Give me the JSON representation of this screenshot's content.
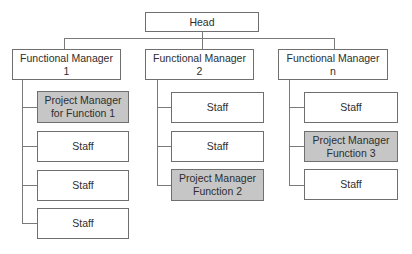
{
  "diagram": {
    "colors": {
      "line": "#7a7a7a",
      "border": "#6f6f6f",
      "pm_fill": "#c6c6c6",
      "staff_fill": "#ffffff",
      "text": "#2e2e2e"
    },
    "head": {
      "label": "Head"
    },
    "columns": [
      {
        "manager": {
          "label_line1": "Functional Manager",
          "label_line2": "1"
        },
        "children": [
          {
            "type": "project-manager",
            "label_line1": "Project Manager",
            "label_line2": "for Function 1"
          },
          {
            "type": "staff",
            "label_line1": "Staff"
          },
          {
            "type": "staff",
            "label_line1": "Staff"
          },
          {
            "type": "staff",
            "label_line1": "Staff"
          }
        ]
      },
      {
        "manager": {
          "label_line1": "Functional Manager",
          "label_line2": "2"
        },
        "children": [
          {
            "type": "staff",
            "label_line1": "Staff"
          },
          {
            "type": "staff",
            "label_line1": "Staff"
          },
          {
            "type": "project-manager",
            "label_line1": "Project Manager",
            "label_line2": "Function 2"
          }
        ]
      },
      {
        "manager": {
          "label_line1": "Functional Manager",
          "label_line2": "n"
        },
        "children": [
          {
            "type": "staff",
            "label_line1": "Staff"
          },
          {
            "type": "project-manager",
            "label_line1": "Project Manager",
            "label_line2": "Function 3"
          },
          {
            "type": "staff",
            "label_line1": "Staff"
          }
        ]
      }
    ]
  }
}
